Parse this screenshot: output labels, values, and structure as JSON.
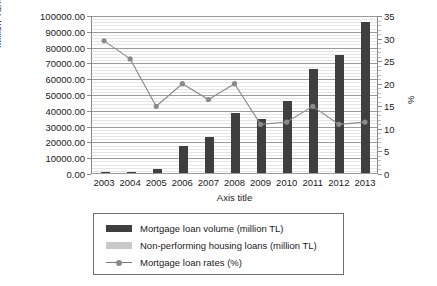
{
  "chart_data": {
    "type": "bar",
    "title": "",
    "xlabel": "Axis title",
    "ylabel": "Million Turkish Lira",
    "y2label": "%",
    "categories": [
      "2003",
      "2004",
      "2005",
      "2006",
      "2007",
      "2008",
      "2009",
      "2010",
      "2011",
      "2012",
      "2013"
    ],
    "ylim": [
      0,
      100000
    ],
    "y2lim": [
      0,
      35
    ],
    "ytick_labels": [
      "0.00",
      "10000.00",
      "20000.00",
      "30000.00",
      "40000.00",
      "50000.00",
      "60000.00",
      "70000.00",
      "80000.00",
      "90000.00",
      "100000.00"
    ],
    "ytick_values": [
      0,
      10000,
      20000,
      30000,
      40000,
      50000,
      60000,
      70000,
      80000,
      90000,
      100000
    ],
    "y2tick_labels": [
      "0",
      "5",
      "10",
      "15",
      "20",
      "25",
      "30",
      "35"
    ],
    "y2tick_values": [
      0,
      5,
      10,
      15,
      20,
      25,
      30,
      35
    ],
    "grid": true,
    "legend_position": "bottom",
    "series": [
      {
        "name": "Mortgage loan volume (million TL)",
        "type": "bar",
        "axis": "left",
        "color": "#3f3f3f",
        "values": [
          300,
          700,
          2800,
          17000,
          23000,
          38000,
          34000,
          45500,
          66000,
          75000,
          95500
        ]
      },
      {
        "name": "Non-performing housing loans (million TL)",
        "type": "bar",
        "axis": "left",
        "color": "#c9c9c9",
        "values": [
          0,
          0,
          0,
          0,
          0,
          0,
          0,
          0,
          0,
          0,
          0
        ]
      },
      {
        "name": "Mortgage loan rates (%)",
        "type": "line",
        "axis": "right",
        "color": "#8a8a8a",
        "values": [
          29.5,
          25.5,
          15.0,
          20.0,
          16.5,
          20.0,
          11.0,
          11.5,
          15.0,
          11.0,
          11.5
        ]
      }
    ]
  },
  "legend": {
    "items": [
      {
        "label": "Mortgage loan volume (million TL)",
        "swatch": "dark-bar-swatch"
      },
      {
        "label": "Non-performing housing loans (million TL)",
        "swatch": "light-bar-swatch"
      },
      {
        "label": "Mortgage loan rates (%)",
        "swatch": "line-marker-swatch"
      }
    ]
  }
}
